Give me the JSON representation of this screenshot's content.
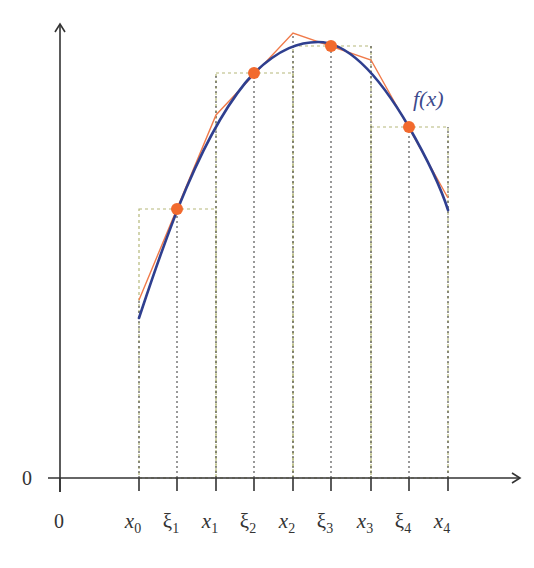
{
  "diagram": {
    "function_label": "f(x)",
    "y_origin_label": "0",
    "x_origin_label": "0",
    "ticks": [
      {
        "id": "x0",
        "base": "x",
        "sub": "0",
        "italic": true,
        "px": 139
      },
      {
        "id": "xi1",
        "base": "ξ",
        "sub": "1",
        "italic": false,
        "px": 177
      },
      {
        "id": "x1",
        "base": "x",
        "sub": "1",
        "italic": true,
        "px": 216
      },
      {
        "id": "xi2",
        "base": "ξ",
        "sub": "2",
        "italic": false,
        "px": 254
      },
      {
        "id": "x2",
        "base": "x",
        "sub": "2",
        "italic": true,
        "px": 293
      },
      {
        "id": "xi3",
        "base": "ξ",
        "sub": "3",
        "italic": false,
        "px": 331
      },
      {
        "id": "x3",
        "base": "x",
        "sub": "3",
        "italic": true,
        "px": 371
      },
      {
        "id": "xi4",
        "base": "ξ",
        "sub": "4",
        "italic": false,
        "px": 409
      },
      {
        "id": "x4",
        "base": "x",
        "sub": "4",
        "italic": true,
        "px": 448
      }
    ],
    "rectangles": [
      {
        "from": "x0",
        "to": "x1",
        "height_at": "xi1",
        "x1": 139,
        "x2": 216,
        "top": 209
      },
      {
        "from": "x1",
        "to": "x2",
        "height_at": "xi2",
        "x1": 216,
        "x2": 293,
        "top": 73
      },
      {
        "from": "x2",
        "to": "x3",
        "height_at": "xi3",
        "x1": 293,
        "x2": 371,
        "top": 46
      },
      {
        "from": "x3",
        "to": "x4",
        "height_at": "xi4",
        "x1": 371,
        "x2": 448,
        "top": 127
      }
    ],
    "sample_points": [
      {
        "label": "f(ξ1)",
        "cx": 177,
        "cy": 209
      },
      {
        "label": "f(ξ2)",
        "cx": 254,
        "cy": 73
      },
      {
        "label": "f(ξ3)",
        "cx": 331,
        "cy": 46
      },
      {
        "label": "f(ξ4)",
        "cx": 409,
        "cy": 127
      }
    ],
    "approx_polyline": "139,300 216,115 293,33 371,60 448,198",
    "curve_path": "M139,318 C160,255 200,130 254,73 C280,48 300,42 318,42 C340,42 370,60 409,127 C425,155 440,185 448,210",
    "colors": {
      "axis": "#333333",
      "curve": "#2f3f8f",
      "polyline": "#f07a4a",
      "points": "#f26a2e",
      "rect_dash": "#b5b87a",
      "dotted_lines": "#555555",
      "function_label": "#3d4a8c"
    }
  }
}
